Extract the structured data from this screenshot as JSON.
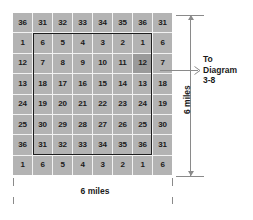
{
  "diagram": {
    "type": "township-section-grid",
    "title_ref": {
      "line1": "To",
      "line2": "Diagram",
      "line3": "3-8"
    },
    "dimensions": {
      "width_label": "6 miles",
      "height_label": "6 miles"
    },
    "grid": {
      "rows": 8,
      "cols": 8,
      "highlight": {
        "row": 3,
        "col": 7,
        "value": "12"
      },
      "outline": {
        "start_row": 2,
        "end_row": 7,
        "start_col": 2,
        "end_col": 7
      },
      "cells": [
        [
          "36",
          "31",
          "32",
          "33",
          "34",
          "35",
          "36",
          "31"
        ],
        [
          "1",
          "6",
          "5",
          "4",
          "3",
          "2",
          "1",
          "6"
        ],
        [
          "12",
          "7",
          "8",
          "9",
          "10",
          "11",
          "12",
          "7"
        ],
        [
          "13",
          "18",
          "17",
          "16",
          "15",
          "14",
          "13",
          "18"
        ],
        [
          "24",
          "19",
          "20",
          "21",
          "22",
          "23",
          "24",
          "19"
        ],
        [
          "25",
          "30",
          "29",
          "28",
          "27",
          "26",
          "25",
          "30"
        ],
        [
          "36",
          "31",
          "32",
          "33",
          "34",
          "35",
          "36",
          "31"
        ],
        [
          "1",
          "6",
          "5",
          "4",
          "3",
          "2",
          "1",
          "6"
        ]
      ]
    },
    "colors": {
      "cell_fill": "#b3b3b3",
      "cell_highlight": "#9a9a9a",
      "gridline": "#f2f2f2",
      "outline": "#1f1f1f",
      "dimension_line": "#8a8a8a",
      "text": "#1a1a1a"
    }
  }
}
